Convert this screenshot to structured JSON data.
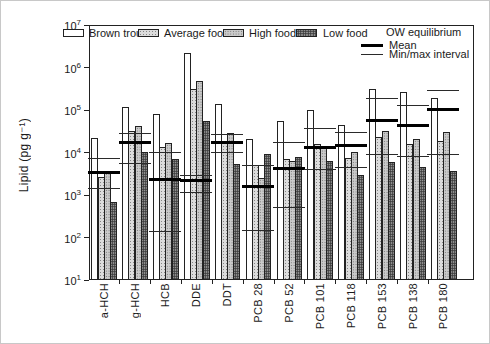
{
  "figure": {
    "ylabel": "Lipid (pg g⁻¹)",
    "legend": {
      "ow_title": "OW equilibrium",
      "mean_label": "Mean",
      "minmax_label": "Min/max interval"
    },
    "colors": {
      "background": "#ffffff",
      "bar_outline": "#222222",
      "equilibrium_line": "#000000",
      "hatch_light": "#dcdcdc",
      "hatch_medium": "#cbcbcb",
      "hatch_dark": "#969696"
    }
  },
  "chart_data": {
    "type": "bar",
    "title": "",
    "xlabel": "",
    "ylabel": "Lipid (pg g⁻¹)",
    "y_scale": "log",
    "ylim": [
      10,
      10000000
    ],
    "y_tick_exponents": [
      1,
      2,
      3,
      4,
      5,
      6,
      7
    ],
    "grid": false,
    "legend_position": "top",
    "categories": [
      "a-HCH",
      "g-HCH",
      "HCB",
      "DDE",
      "DDT",
      "PCB 28",
      "PCB 52",
      "PCB 101",
      "PCB 118",
      "PCB 153",
      "PCB 138",
      "PCB 180"
    ],
    "series": [
      {
        "name": "Brown trout",
        "fill": "white",
        "values": [
          22000,
          120000,
          80000,
          2200000,
          140000,
          21000,
          55000,
          100000,
          45000,
          310000,
          270000,
          190000
        ]
      },
      {
        "name": "Average food",
        "fill": "hatch-light",
        "values": [
          2600,
          32000,
          13500,
          320000,
          19000,
          5200,
          7000,
          16000,
          7500,
          23000,
          16000,
          19000
        ]
      },
      {
        "name": "High food",
        "fill": "hatch-medium",
        "values": [
          3400,
          42000,
          17000,
          490000,
          29000,
          2500,
          6500,
          14500,
          10500,
          33000,
          21000,
          31000
        ]
      },
      {
        "name": "Low food",
        "fill": "hatch-dark",
        "values": [
          700,
          10500,
          7000,
          55000,
          5500,
          9400,
          8000,
          6500,
          3000,
          6000,
          4500,
          3600
        ]
      }
    ],
    "equilibrium": {
      "name": "OW equilibrium",
      "mean": [
        3400,
        17000,
        2300,
        2200,
        17000,
        1600,
        4200,
        13500,
        15000,
        58000,
        44000,
        105000
      ],
      "max": [
        7500,
        29000,
        10500,
        3000,
        28000,
        5000,
        18000,
        37000,
        30000,
        190000,
        130000,
        300000
      ],
      "min": [
        1500,
        5800,
        140,
        1200,
        10500,
        150,
        530,
        4200,
        4500,
        9000,
        8500,
        9000
      ]
    }
  }
}
